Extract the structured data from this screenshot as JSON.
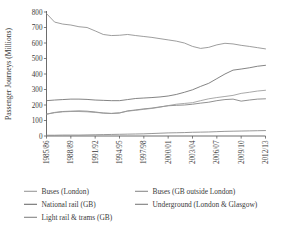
{
  "chart_data": {
    "type": "line",
    "title": "",
    "xlabel": "",
    "ylabel": "Passenger Journeys (Millions)",
    "ylim": [
      0,
      800
    ],
    "yticks": [
      0,
      100,
      200,
      300,
      400,
      500,
      600,
      700,
      800
    ],
    "grid": false,
    "legend_position": "bottom",
    "x": [
      "1985/86",
      "1986/87",
      "1987/88",
      "1988/89",
      "1989/90",
      "1990/91",
      "1991/92",
      "1992/93",
      "1993/94",
      "1994/95",
      "1995/96",
      "1996/97",
      "1997/98",
      "1998/99",
      "1999/00",
      "2000/01",
      "2001/02",
      "2002/03",
      "2003/04",
      "2004/05",
      "2005/06",
      "2006/07",
      "2007/08",
      "2008/09",
      "2009/10",
      "2010/11",
      "2011/12",
      "2012/13"
    ],
    "xtick_labels": [
      "1985/86",
      "1988/89",
      "1991/92",
      "1994/95",
      "1997/98",
      "2000/01",
      "2003/04",
      "2006/07",
      "2009/10",
      "2012/13"
    ],
    "xtick_indices": [
      0,
      3,
      6,
      9,
      12,
      15,
      18,
      21,
      24,
      27
    ],
    "series": [
      {
        "name": "Buses (GB outside London)",
        "color": "#8c8c8c",
        "values": [
          790,
          735,
          722,
          716,
          705,
          700,
          678,
          655,
          648,
          650,
          655,
          648,
          642,
          636,
          628,
          620,
          612,
          600,
          578,
          565,
          572,
          588,
          598,
          594,
          585,
          578,
          570,
          562
        ]
      },
      {
        "name": "National rail (GB)",
        "color": "#6e6e6e",
        "values": [
          228,
          232,
          235,
          238,
          238,
          236,
          232,
          230,
          228,
          228,
          235,
          242,
          245,
          248,
          252,
          258,
          268,
          282,
          298,
          320,
          340,
          370,
          400,
          425,
          432,
          440,
          450,
          456
        ]
      },
      {
        "name": "Underground (London & Glasgow)",
        "color": "#7d7d7d",
        "values": [
          140,
          152,
          158,
          160,
          162,
          160,
          155,
          148,
          145,
          148,
          162,
          168,
          175,
          180,
          188,
          195,
          198,
          200,
          205,
          212,
          218,
          228,
          235,
          238,
          225,
          232,
          238,
          240
        ]
      },
      {
        "name": "Buses (London)",
        "color": "#9a9a9a",
        "values": [
          142,
          150,
          156,
          158,
          158,
          156,
          152,
          148,
          146,
          150,
          160,
          166,
          172,
          178,
          186,
          196,
          205,
          210,
          215,
          228,
          240,
          248,
          255,
          262,
          275,
          282,
          290,
          295
        ]
      },
      {
        "name": "Light rail & trams (GB)",
        "color": "#858585",
        "values": [
          5,
          5,
          6,
          6,
          6,
          7,
          8,
          9,
          10,
          11,
          12,
          13,
          14,
          16,
          18,
          20,
          21,
          22,
          24,
          25,
          26,
          28,
          30,
          31,
          32,
          33,
          34,
          35
        ]
      }
    ]
  },
  "legend": {
    "items": [
      {
        "label": "Buses (London)",
        "color": "#9a9a9a"
      },
      {
        "label": "Buses (GB outside London)",
        "color": "#8c8c8c"
      },
      {
        "label": "National rail (GB)",
        "color": "#6e6e6e"
      },
      {
        "label": "Underground (London & Glasgow)",
        "color": "#7d7d7d"
      },
      {
        "label": "Light rail & trams (GB)",
        "color": "#858585"
      }
    ]
  },
  "axes": {
    "y_axis_title": "Passenger Journeys (Millions)",
    "y_tick_labels": [
      "0",
      "100",
      "200",
      "300",
      "400",
      "500",
      "600",
      "700",
      "800"
    ],
    "x_tick_labels": [
      "1985/86",
      "1988/89",
      "1991/92",
      "1994/95",
      "1997/98",
      "2000/01",
      "2003/04",
      "2006/07",
      "2009/10",
      "2012/13"
    ]
  }
}
